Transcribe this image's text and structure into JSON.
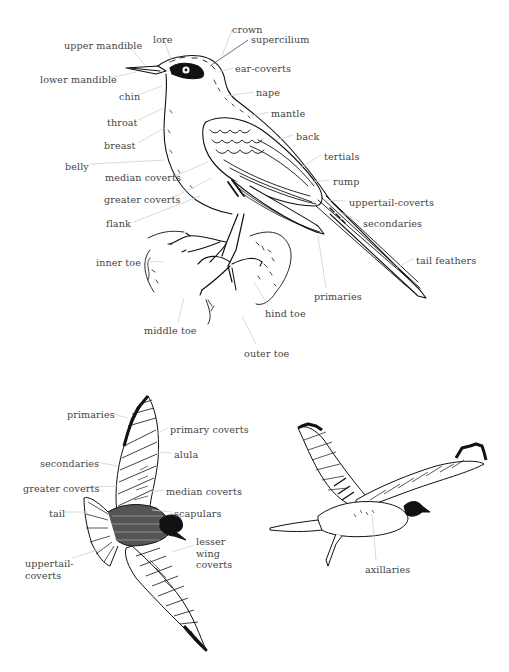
{
  "diagram": {
    "perched_bird": {
      "labels": [
        {
          "id": "crown",
          "text": "crown",
          "x": 232,
          "y": 24
        },
        {
          "id": "lore",
          "text": "lore",
          "x": 153,
          "y": 34
        },
        {
          "id": "supercilium",
          "text": "supercilium",
          "x": 251,
          "y": 34
        },
        {
          "id": "upper-mandible",
          "text": "upper mandible",
          "x": 64,
          "y": 40
        },
        {
          "id": "ear-coverts",
          "text": "ear-coverts",
          "x": 235,
          "y": 63
        },
        {
          "id": "lower-mandible",
          "text": "lower mandible",
          "x": 40,
          "y": 74
        },
        {
          "id": "nape",
          "text": "nape",
          "x": 256,
          "y": 87
        },
        {
          "id": "chin",
          "text": "chin",
          "x": 119,
          "y": 91
        },
        {
          "id": "mantle",
          "text": "mantle",
          "x": 271,
          "y": 108
        },
        {
          "id": "throat",
          "text": "throat",
          "x": 107,
          "y": 117
        },
        {
          "id": "back",
          "text": "back",
          "x": 296,
          "y": 131
        },
        {
          "id": "breast",
          "text": "breast",
          "x": 104,
          "y": 140
        },
        {
          "id": "tertials",
          "text": "tertials",
          "x": 324,
          "y": 151
        },
        {
          "id": "belly",
          "text": "belly",
          "x": 65,
          "y": 161
        },
        {
          "id": "median-coverts",
          "text": "median coverts",
          "x": 105,
          "y": 172
        },
        {
          "id": "rump",
          "text": "rump",
          "x": 333,
          "y": 176
        },
        {
          "id": "greater-coverts",
          "text": "greater coverts",
          "x": 104,
          "y": 194
        },
        {
          "id": "uppertail-coverts",
          "text": "uppertail-coverts",
          "x": 349,
          "y": 197
        },
        {
          "id": "flank",
          "text": "flank",
          "x": 106,
          "y": 218
        },
        {
          "id": "secondaries",
          "text": "secondaries",
          "x": 363,
          "y": 218
        },
        {
          "id": "inner-toe",
          "text": "inner toe",
          "x": 96,
          "y": 257
        },
        {
          "id": "tail-feathers",
          "text": "tail feathers",
          "x": 416,
          "y": 255
        },
        {
          "id": "primaries",
          "text": "primaries",
          "x": 314,
          "y": 291
        },
        {
          "id": "hind-toe",
          "text": "hind toe",
          "x": 265,
          "y": 308
        },
        {
          "id": "middle-toe",
          "text": "middle toe",
          "x": 144,
          "y": 325
        },
        {
          "id": "outer-toe",
          "text": "outer toe",
          "x": 244,
          "y": 348
        }
      ]
    },
    "flying_bird_above": {
      "labels": [
        {
          "id": "primaries",
          "text": "primaries",
          "x": 67,
          "y": 409
        },
        {
          "id": "primary-coverts",
          "text": "primary coverts",
          "x": 170,
          "y": 424
        },
        {
          "id": "alula",
          "text": "alula",
          "x": 174,
          "y": 449
        },
        {
          "id": "secondaries",
          "text": "secondaries",
          "x": 40,
          "y": 458
        },
        {
          "id": "greater-coverts",
          "text": "greater coverts",
          "x": 23,
          "y": 483
        },
        {
          "id": "median-coverts",
          "text": "median coverts",
          "x": 166,
          "y": 486
        },
        {
          "id": "tail",
          "text": "tail",
          "x": 49,
          "y": 508
        },
        {
          "id": "scapulars",
          "text": "scapulars",
          "x": 174,
          "y": 508
        },
        {
          "id": "lesser-wing-coverts",
          "text": "lesser wing coverts",
          "x": 196,
          "y": 536,
          "lines": [
            "lesser",
            "wing",
            "coverts"
          ]
        },
        {
          "id": "uppertail-coverts",
          "text": "uppertail-coverts",
          "x": 25,
          "y": 558,
          "lines": [
            "uppertail-",
            "coverts"
          ]
        }
      ]
    },
    "flying_bird_below": {
      "labels": [
        {
          "id": "axillaries",
          "text": "axillaries",
          "x": 365,
          "y": 564
        }
      ]
    },
    "colors": {
      "ink": "#111111",
      "label_text": "#444444",
      "leader_line": "#c8c8c8",
      "background": "#ffffff"
    }
  }
}
